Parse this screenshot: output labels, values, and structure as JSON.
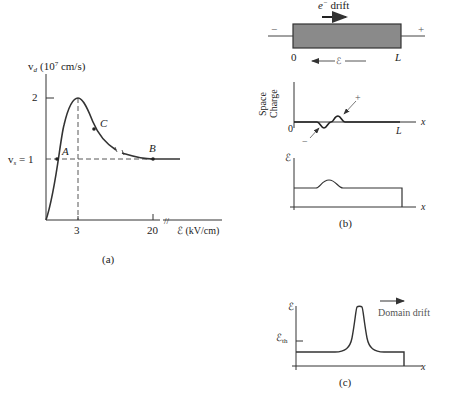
{
  "panel_a": {
    "caption": "(a)",
    "y_axis_label": "v",
    "y_axis_sub": "d",
    "y_axis_unit": "(10",
    "y_axis_exp": "7",
    "y_axis_unit_end": " cm/s)",
    "y_tick_2": "2",
    "y_tick_vs_v": "v",
    "y_tick_vs_sub": "s",
    "y_tick_vs_eq": " = 1",
    "x_tick_3": "3",
    "x_tick_20": "20",
    "x_axis_label": "ℰ (kV/cm)",
    "point_A": "A",
    "point_B": "B",
    "point_C": "C"
  },
  "panel_b": {
    "caption": "(b)",
    "drift_label": "e",
    "drift_sup": "−",
    "drift_text": " drift",
    "minus_terminal": "−",
    "plus_terminal": "+",
    "left_pos": "0",
    "right_pos": "L",
    "field_label": "ℰ",
    "space_charge_line1": "Space",
    "space_charge_line2": "Charge",
    "sc_origin": "0",
    "sc_L": "L",
    "sc_x": "x",
    "sc_plus": "+",
    "sc_minus": "−",
    "field_axis": "ℰ",
    "field_x": "x"
  },
  "panel_c": {
    "caption": "(c)",
    "y_axis": "ℰ",
    "threshold": "ℰ",
    "threshold_sub": "th",
    "x_axis": "x",
    "domain_drift": "Domain drift"
  }
}
